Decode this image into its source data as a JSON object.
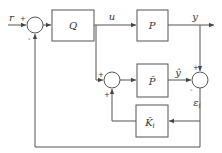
{
  "diagram": {
    "type": "block-diagram",
    "blocks": {
      "controller": {
        "label": "Q"
      },
      "plant": {
        "label": "P"
      },
      "model": {
        "label": "P̂"
      },
      "estimator": {
        "label": "K̂",
        "subscript": "i"
      }
    },
    "signals": {
      "reference": "r",
      "control": "u",
      "output": "y",
      "model_output": "ŷ",
      "error": "ε",
      "error_subscript": "i"
    },
    "summing_junctions": {
      "input_sum": {
        "signs": [
          "+",
          "-"
        ]
      },
      "model_sum": {
        "signs": [
          "+",
          "+"
        ]
      },
      "error_sum": {
        "signs": [
          "+",
          "-"
        ]
      }
    }
  }
}
